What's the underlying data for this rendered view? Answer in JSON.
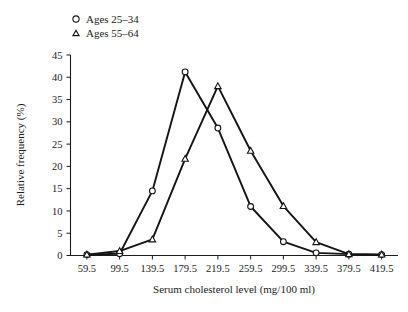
{
  "chart_data": {
    "type": "line",
    "title": "",
    "xlabel": "Serum cholesterol level (mg/100 ml)",
    "ylabel": "Relative frequency (%)",
    "x": [
      59.5,
      99.5,
      139.5,
      179.5,
      219.5,
      259.5,
      299.5,
      339.5,
      379.5,
      419.5
    ],
    "xticklabels": [
      "59.5",
      "99.5",
      "139.5",
      "179.5",
      "219.5",
      "259.5",
      "299.5",
      "339.5",
      "379.5",
      "419.5"
    ],
    "yticklabels": [
      "0",
      "5",
      "10",
      "15",
      "20",
      "25",
      "30",
      "35",
      "40",
      "45"
    ],
    "yticks": [
      0,
      5,
      10,
      15,
      20,
      25,
      30,
      35,
      40,
      45
    ],
    "ylim": [
      0,
      45
    ],
    "xlim": [
      59.5,
      419.5
    ],
    "grid": false,
    "legend_position": "top-left",
    "series": [
      {
        "name": "Ages 25–34",
        "marker": "circle-open",
        "color": "#141414",
        "values": [
          0.2,
          0.4,
          14.5,
          41.2,
          28.6,
          11.0,
          3.1,
          0.6,
          0.3,
          0.2
        ]
      },
      {
        "name": "Ages 55–64",
        "marker": "triangle-open",
        "color": "#141414",
        "values": [
          0.2,
          1.0,
          3.6,
          21.7,
          38.0,
          23.5,
          11.1,
          3.0,
          0.3,
          0.2
        ]
      }
    ]
  },
  "legend": {
    "entries": [
      {
        "label": "Ages 25–34",
        "marker": "circle-open"
      },
      {
        "label": "Ages 55–64",
        "marker": "triangle-open"
      }
    ]
  },
  "axes": {
    "x_title": "Serum cholesterol level (mg/100 ml)",
    "y_title": "Relative frequency (%)"
  }
}
